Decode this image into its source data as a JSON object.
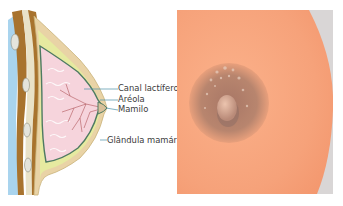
{
  "diagram": {
    "labels": [
      {
        "id": "canal-lactifero",
        "text": "Canal lactífero"
      },
      {
        "id": "areola",
        "text": "Aréola"
      },
      {
        "id": "mamilo",
        "text": "Mamilo"
      },
      {
        "id": "glandula-mamaria",
        "text": "Glândula mamária"
      }
    ],
    "colors": {
      "muscle": "#a8732e",
      "skin_outer": "#e9d3a6",
      "fat": "#e6eaa0",
      "gland": "#f6d4dc",
      "outline": "#4e7a62",
      "chest_wall": "#a9d4ee",
      "leader_line": "#4a90a8"
    }
  },
  "photo": {
    "subject": "areola-and-nipple-photo",
    "colors": {
      "skin": "#f7a47c",
      "areola": "#b8856e",
      "nipple": "#d8a690",
      "shadow": "#c9c3c3"
    }
  }
}
